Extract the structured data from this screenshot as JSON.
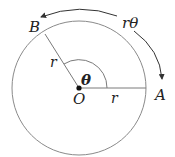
{
  "diagram": {
    "labels": {
      "point_a": "A",
      "point_b": "B",
      "center": "O",
      "radius_ob": "r",
      "radius_oa": "r",
      "angle": "θ",
      "arc_length": "rθ"
    },
    "colors": {
      "circle": "#8a8a8a",
      "radius_lines": "#7a7a7a",
      "arrow": "#333333",
      "text": "#222222",
      "center_dot": "#111111"
    }
  }
}
